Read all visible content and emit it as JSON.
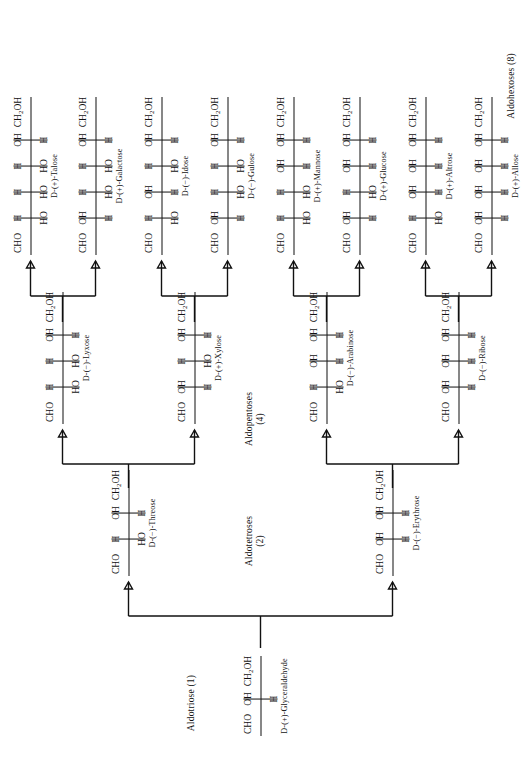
{
  "diagram": {
    "group_captions": [
      {
        "id": "aldotriose",
        "text": "Aldotriose (1)"
      },
      {
        "id": "aldotetroses",
        "line1": "Aldotetroses",
        "line2": "(2)"
      },
      {
        "id": "aldopentoses",
        "line1": "Aldopentoses",
        "line2": "(4)"
      },
      {
        "id": "aldohexoses",
        "text": "Aldohexoses (8)"
      }
    ],
    "tokens": {
      "cho": "CHO",
      "ch2oh": "CH",
      "ch2oh_sub": "2",
      "ch2oh_tail": "OH",
      "h": "H",
      "oh": "OH",
      "ho": "HO"
    },
    "sugars": [
      {
        "id": "glyceraldehyde",
        "label": "D-(+)-Glyceraldehyde",
        "top": "CHO",
        "bottom": "CH2OH",
        "centers": [
          {
            "left": "H",
            "right": "OH"
          }
        ]
      },
      {
        "id": "erythrose",
        "label": "D-(−)-Erythrose",
        "top": "CHO",
        "bottom": "CH2OH",
        "centers": [
          {
            "left": "H",
            "right": "OH"
          },
          {
            "left": "H",
            "right": "OH"
          }
        ]
      },
      {
        "id": "threose",
        "label": "D-(−)-Threose",
        "top": "CHO",
        "bottom": "CH2OH",
        "centers": [
          {
            "left": "HO",
            "right": "H"
          },
          {
            "left": "H",
            "right": "OH"
          }
        ]
      },
      {
        "id": "ribose",
        "label": "D-(−)-Ribose",
        "top": "CHO",
        "bottom": "CH2OH",
        "centers": [
          {
            "left": "H",
            "right": "OH"
          },
          {
            "left": "H",
            "right": "OH"
          },
          {
            "left": "H",
            "right": "OH"
          }
        ]
      },
      {
        "id": "arabinose",
        "label": "D-(−)-Arabinose",
        "top": "CHO",
        "bottom": "CH2OH",
        "centers": [
          {
            "left": "HO",
            "right": "H"
          },
          {
            "left": "H",
            "right": "OH"
          },
          {
            "left": "H",
            "right": "OH"
          }
        ]
      },
      {
        "id": "xylose",
        "label": "D-(+)-Xylose",
        "top": "CHO",
        "bottom": "CH2OH",
        "centers": [
          {
            "left": "H",
            "right": "OH"
          },
          {
            "left": "HO",
            "right": "H"
          },
          {
            "left": "H",
            "right": "OH"
          }
        ]
      },
      {
        "id": "lyxose",
        "label": "D-(−)-Lyxose",
        "top": "CHO",
        "bottom": "CH2OH",
        "centers": [
          {
            "left": "HO",
            "right": "H"
          },
          {
            "left": "HO",
            "right": "H"
          },
          {
            "left": "H",
            "right": "OH"
          }
        ]
      },
      {
        "id": "allose",
        "label": "D-(+)-Allose",
        "top": "CHO",
        "bottom": "CH2OH",
        "centers": [
          {
            "left": "H",
            "right": "OH"
          },
          {
            "left": "H",
            "right": "OH"
          },
          {
            "left": "H",
            "right": "OH"
          },
          {
            "left": "H",
            "right": "OH"
          }
        ]
      },
      {
        "id": "altrose",
        "label": "D-(+)-Altrose",
        "top": "CHO",
        "bottom": "CH2OH",
        "centers": [
          {
            "left": "HO",
            "right": "H"
          },
          {
            "left": "H",
            "right": "OH"
          },
          {
            "left": "H",
            "right": "OH"
          },
          {
            "left": "H",
            "right": "OH"
          }
        ]
      },
      {
        "id": "glucose",
        "label": "D-(+)-Glucose",
        "top": "CHO",
        "bottom": "CH2OH",
        "centers": [
          {
            "left": "H",
            "right": "OH"
          },
          {
            "left": "HO",
            "right": "H"
          },
          {
            "left": "H",
            "right": "OH"
          },
          {
            "left": "H",
            "right": "OH"
          }
        ]
      },
      {
        "id": "mannose",
        "label": "D-(+)-Mannose",
        "top": "CHO",
        "bottom": "CH2OH",
        "centers": [
          {
            "left": "HO",
            "right": "H"
          },
          {
            "left": "HO",
            "right": "H"
          },
          {
            "left": "H",
            "right": "OH"
          },
          {
            "left": "H",
            "right": "OH"
          }
        ]
      },
      {
        "id": "gulose",
        "label": "D-(−)-Gulose",
        "top": "CHO",
        "bottom": "CH2OH",
        "centers": [
          {
            "left": "H",
            "right": "OH"
          },
          {
            "left": "HO",
            "right": "H"
          },
          {
            "left": "HO",
            "right": "H"
          },
          {
            "left": "H",
            "right": "OH"
          }
        ]
      },
      {
        "id": "idose",
        "label": "D-(−)-Idose",
        "top": "CHO",
        "bottom": "CH2OH",
        "centers": [
          {
            "left": "HO",
            "right": "H"
          },
          {
            "left": "H",
            "right": "OH"
          },
          {
            "left": "HO",
            "right": "H"
          },
          {
            "left": "H",
            "right": "OH"
          }
        ]
      },
      {
        "id": "galactose",
        "label": "D-(+)-Galactose",
        "top": "CHO",
        "bottom": "CH2OH",
        "centers": [
          {
            "left": "H",
            "right": "OH"
          },
          {
            "left": "HO",
            "right": "H"
          },
          {
            "left": "HO",
            "right": "H"
          },
          {
            "left": "H",
            "right": "OH"
          }
        ]
      },
      {
        "id": "talose",
        "label": "D-(+)-Talose",
        "top": "CHO",
        "bottom": "CH2OH",
        "centers": [
          {
            "left": "HO",
            "right": "H"
          },
          {
            "left": "HO",
            "right": "H"
          },
          {
            "left": "HO",
            "right": "H"
          },
          {
            "left": "H",
            "right": "OH"
          }
        ]
      }
    ]
  }
}
